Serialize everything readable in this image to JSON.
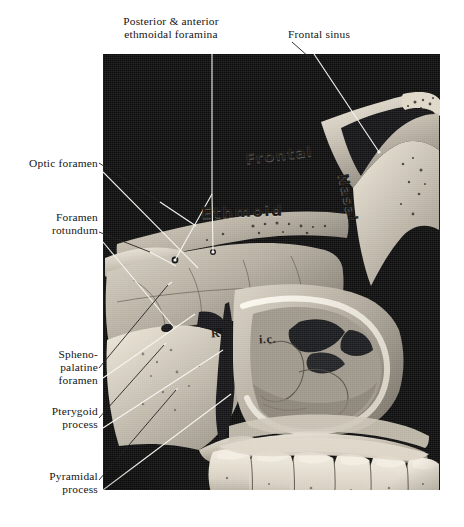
{
  "figure": {
    "kind": "anatomical-photograph",
    "plate_background": "#0d0d0d",
    "page_background": "#ffffff"
  },
  "labels": {
    "top": [
      {
        "id": "ethmoidal-foramina",
        "text": "Posterior  &  anterior\nethmoidal foramina",
        "align": "center"
      },
      {
        "id": "frontal-sinus",
        "text": "Frontal sinus",
        "align": "left"
      }
    ],
    "left": [
      {
        "id": "optic-foramen",
        "text": "Optic foramen",
        "align": "right"
      },
      {
        "id": "foramen-rotundum",
        "text": "Foramen\nrotundum",
        "align": "right"
      },
      {
        "id": "sphenopalatine",
        "text": "Spheno-\npalatine\nforamen",
        "align": "right"
      },
      {
        "id": "pterygoid-process",
        "text": "Pterygoid\nprocess",
        "align": "right"
      },
      {
        "id": "pyramidal-process",
        "text": "Pyramidal\nprocess",
        "align": "right"
      }
    ]
  },
  "inked_labels": [
    {
      "id": "frontal",
      "text": "Frontal",
      "style": "handwritten"
    },
    {
      "id": "ethmoid",
      "text": "Ethmoid",
      "style": "handwritten"
    },
    {
      "id": "nasal",
      "text": "Nasal",
      "style": "handwritten-rotated"
    },
    {
      "id": "concha-r",
      "text": "R.",
      "style": "handwritten-small"
    },
    {
      "id": "concha-ic",
      "text": "i.c.",
      "style": "handwritten-small"
    }
  ],
  "colors": {
    "bone_light": "#e9e5dc",
    "bone_mid": "#b9b2a6",
    "bone_shadow": "#6e6860",
    "cavity_dark": "#17171a",
    "leader_line": "#f2f0ea",
    "text": "#151515"
  }
}
